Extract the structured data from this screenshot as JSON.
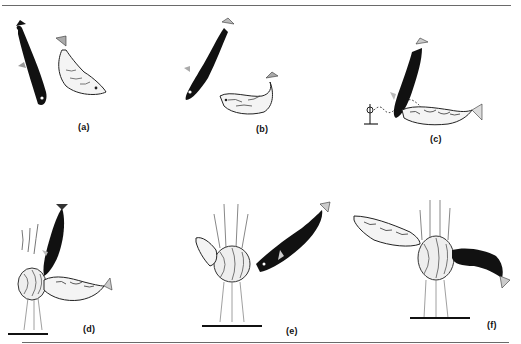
{
  "figure": {
    "panels": [
      {
        "id": "a",
        "label": "(a)",
        "description": "Dark male fish and pale, swollen gravid female facing each other"
      },
      {
        "id": "b",
        "label": "(b)",
        "description": "Male dives head-down; female bends upward in head-up posture"
      },
      {
        "id": "c",
        "label": "(c)",
        "description": "Male leads female along dotted path toward nest marker"
      },
      {
        "id": "d",
        "label": "(d)",
        "description": "Male points head at nest entrance; female beside nest"
      },
      {
        "id": "e",
        "label": "(e)",
        "description": "Female enters nest while male nudges from behind"
      },
      {
        "id": "f",
        "label": "(f)",
        "description": "Female exits through nest; male follows through"
      }
    ],
    "colors": {
      "ink": "#111111",
      "rule": "#6a6a6a",
      "female_fill": "#f4f4f4",
      "weed": "#777777"
    }
  }
}
